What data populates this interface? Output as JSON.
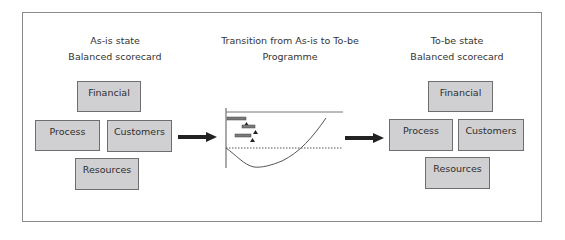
{
  "as_is": {
    "title": "As-is state",
    "subtitle": "Balanced scorecard",
    "boxes": {
      "financial": "Financial",
      "process": "Process",
      "customers": "Customers",
      "resources": "Resources"
    }
  },
  "transition": {
    "title": "Transition from As-is to To-be",
    "subtitle": "Programme",
    "chart": {
      "gantt_bars": 3,
      "milestones": 3,
      "curve": "J-curve dipping below baseline then rising above",
      "baseline": "dotted"
    }
  },
  "to_be": {
    "title": "To-be state",
    "subtitle": "Balanced scorecard",
    "boxes": {
      "financial": "Financial",
      "process": "Process",
      "customers": "Customers",
      "resources": "Resources"
    }
  },
  "colors": {
    "box_fill": "#d0d0d2",
    "box_border": "#6e6e6e",
    "frame_border": "#8a8a8a",
    "arrow": "#222222",
    "gantt_bar": "#7a7a7a"
  }
}
